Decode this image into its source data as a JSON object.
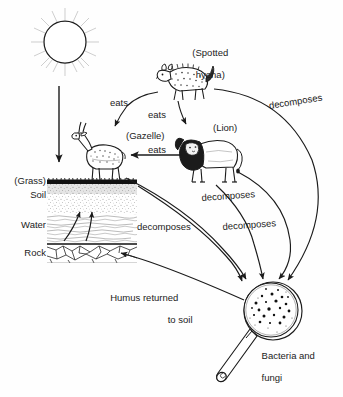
{
  "diagram": {
    "type": "food-web-nutrient-cycle",
    "background_color": "#fefefe",
    "ink_color": "#1b1b1b",
    "nodes": [
      {
        "id": "sun",
        "label": "",
        "kind": "sun",
        "x": 65,
        "y": 42
      },
      {
        "id": "grass",
        "label": "(Grass)",
        "kind": "producer",
        "x": 26,
        "y": 181
      },
      {
        "id": "soil",
        "label": "Soil",
        "kind": "substrate",
        "x": 32,
        "y": 195
      },
      {
        "id": "water",
        "label": "Water",
        "kind": "substrate",
        "x": 26,
        "y": 225
      },
      {
        "id": "rock",
        "label": "Rock",
        "kind": "substrate",
        "x": 30,
        "y": 253
      },
      {
        "id": "gazelle",
        "label": "(Gazelle)",
        "kind": "herbivore",
        "x": 148,
        "y": 136
      },
      {
        "id": "hyena",
        "label": "(Spotted\nhyena)",
        "kind": "carnivore",
        "x": 203,
        "y": 44
      },
      {
        "id": "lion",
        "label": "(Lion)",
        "kind": "carnivore",
        "x": 230,
        "y": 128
      },
      {
        "id": "microbes",
        "label": "Bacteria and\nfungi",
        "kind": "decomposer",
        "x": 282,
        "y": 347
      }
    ],
    "edges": [
      {
        "id": "e-sun-grass",
        "label": "",
        "from": "sun",
        "to": "grass"
      },
      {
        "id": "e-hyena-gazelle",
        "label": "eats",
        "from": "hyena",
        "to": "gazelle"
      },
      {
        "id": "e-hyena-lion",
        "label": "eats",
        "from": "hyena",
        "to": "lion"
      },
      {
        "id": "e-lion-gazelle",
        "label": "eats",
        "from": "lion",
        "to": "gazelle"
      },
      {
        "id": "e-hyena-microbes",
        "label": "decomposes",
        "from": "hyena",
        "to": "microbes"
      },
      {
        "id": "e-lion-microbes",
        "label": "decomposes",
        "from": "lion",
        "to": "microbes"
      },
      {
        "id": "e-gazelle-microbes",
        "label": "decomposes",
        "from": "gazelle",
        "to": "microbes"
      },
      {
        "id": "e-grass-microbes",
        "label": "decomposes",
        "from": "grass",
        "to": "microbes"
      },
      {
        "id": "e-microbes-soil",
        "label": "Humus returned\nto soil",
        "from": "microbes",
        "to": "soil"
      }
    ]
  },
  "labels": {
    "spotted_hyena_line1": "(Spotted",
    "spotted_hyena_line2": "hyena)",
    "lion": "(Lion)",
    "gazelle": "(Gazelle)",
    "grass": "(Grass)",
    "soil": "Soil",
    "water": "Water",
    "rock": "Rock",
    "eats_hyena_gazelle": "eats",
    "eats_hyena_lion": "eats",
    "eats_lion_gazelle": "eats",
    "decomposes_hyena": "decomposes",
    "decomposes_lion_upper": "decomposes",
    "decomposes_lion_lower": "decomposes",
    "decomposes_grass": "decomposes",
    "humus_line1": "Humus returned",
    "humus_line2": "to soil",
    "bacteria_line1": "Bacteria and",
    "bacteria_line2": "fungi"
  },
  "icons": {
    "sun": "sun-icon",
    "gazelle": "gazelle-icon",
    "hyena": "spotted-hyena-icon",
    "lion": "lion-icon",
    "magnifier": "magnifying-glass-icon",
    "soil_profile": "soil-profile-icon"
  }
}
